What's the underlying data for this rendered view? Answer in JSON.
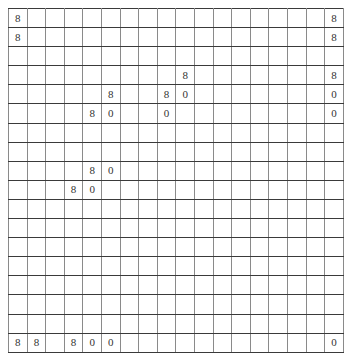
{
  "grid": {
    "rows": 18,
    "cols": 18,
    "line_color": "#3a3a3a",
    "text_color": "#333333",
    "cells": [
      [
        "8",
        "",
        "",
        "",
        "",
        "",
        "",
        "",
        "",
        "",
        "",
        "",
        "",
        "",
        "",
        "",
        "",
        "8"
      ],
      [
        "8",
        "",
        "",
        "",
        "",
        "",
        "",
        "",
        "",
        "",
        "",
        "",
        "",
        "",
        "",
        "",
        "",
        "8"
      ],
      [
        "",
        "",
        "",
        "",
        "",
        "",
        "",
        "",
        "",
        "",
        "",
        "",
        "",
        "",
        "",
        "",
        "",
        ""
      ],
      [
        "",
        "",
        "",
        "",
        "",
        "",
        "",
        "",
        "",
        "8",
        "",
        "",
        "",
        "",
        "",
        "",
        "",
        "8"
      ],
      [
        "",
        "",
        "",
        "",
        "",
        "8",
        "",
        "",
        "8",
        "0",
        "",
        "",
        "",
        "",
        "",
        "",
        "",
        "0"
      ],
      [
        "",
        "",
        "",
        "",
        "8",
        "0",
        "",
        "",
        "0",
        "",
        "",
        "",
        "",
        "",
        "",
        "",
        "",
        "0"
      ],
      [
        "",
        "",
        "",
        "",
        "",
        "",
        "",
        "",
        "",
        "",
        "",
        "",
        "",
        "",
        "",
        "",
        "",
        ""
      ],
      [
        "",
        "",
        "",
        "",
        "",
        "",
        "",
        "",
        "",
        "",
        "",
        "",
        "",
        "",
        "",
        "",
        "",
        ""
      ],
      [
        "",
        "",
        "",
        "",
        "8",
        "0",
        "",
        "",
        "",
        "",
        "",
        "",
        "",
        "",
        "",
        "",
        "",
        ""
      ],
      [
        "",
        "",
        "",
        "8",
        "0",
        "",
        "",
        "",
        "",
        "",
        "",
        "",
        "",
        "",
        "",
        "",
        "",
        ""
      ],
      [
        "",
        "",
        "",
        "",
        "",
        "",
        "",
        "",
        "",
        "",
        "",
        "",
        "",
        "",
        "",
        "",
        "",
        ""
      ],
      [
        "",
        "",
        "",
        "",
        "",
        "",
        "",
        "",
        "",
        "",
        "",
        "",
        "",
        "",
        "",
        "",
        "",
        ""
      ],
      [
        "",
        "",
        "",
        "",
        "",
        "",
        "",
        "",
        "",
        "",
        "",
        "",
        "",
        "",
        "",
        "",
        "",
        ""
      ],
      [
        "",
        "",
        "",
        "",
        "",
        "",
        "",
        "",
        "",
        "",
        "",
        "",
        "",
        "",
        "",
        "",
        "",
        ""
      ],
      [
        "",
        "",
        "",
        "",
        "",
        "",
        "",
        "",
        "",
        "",
        "",
        "",
        "",
        "",
        "",
        "",
        "",
        ""
      ],
      [
        "",
        "",
        "",
        "",
        "",
        "",
        "",
        "",
        "",
        "",
        "",
        "",
        "",
        "",
        "",
        "",
        "",
        ""
      ],
      [
        "",
        "",
        "",
        "",
        "",
        "",
        "",
        "",
        "",
        "",
        "",
        "",
        "",
        "",
        "",
        "",
        "",
        ""
      ],
      [
        "8",
        "8",
        "",
        "8",
        "0",
        "0",
        "",
        "",
        "",
        "",
        "",
        "",
        "",
        "",
        "",
        "",
        "",
        "0"
      ]
    ]
  }
}
